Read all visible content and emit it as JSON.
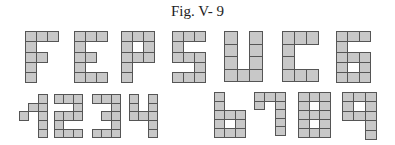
{
  "caption": "Fig. V- 9",
  "colors": {
    "fill": "#c8c8c8",
    "stroke": "#555555",
    "hole": "#ffffff"
  },
  "glyphs": [
    {
      "char": "F",
      "x": 25,
      "y": 31,
      "cw": 11,
      "ch": 10.3,
      "rows": [
        "###",
        "#..",
        "##.",
        "#..",
        "#.."
      ]
    },
    {
      "char": "E",
      "x": 74,
      "y": 31,
      "cw": 11,
      "ch": 10.3,
      "rows": [
        "###",
        "#..",
        "##.",
        "#..",
        "###"
      ]
    },
    {
      "char": "P",
      "x": 121,
      "y": 31,
      "cw": 11,
      "ch": 10.3,
      "rows": [
        "###",
        "#o#",
        "###",
        "#..",
        "#.."
      ]
    },
    {
      "char": "S",
      "x": 172,
      "y": 31,
      "cw": 11,
      "ch": 10.3,
      "rows": [
        "###",
        "#..",
        "###",
        "..#",
        "###"
      ]
    },
    {
      "char": "U",
      "x": 224,
      "y": 31,
      "cw": 12.7,
      "ch": 12.5,
      "rows": [
        "#.#",
        "#.#",
        "#.#",
        "###"
      ]
    },
    {
      "char": "C",
      "x": 282,
      "y": 31,
      "cw": 12,
      "ch": 12.5,
      "rows": [
        "###",
        "#..",
        "#..",
        "###"
      ]
    },
    {
      "char": "6",
      "x": 336,
      "y": 31,
      "cw": 11.3,
      "ch": 10.3,
      "rows": [
        "###",
        "#..",
        "###",
        "#o#",
        "###"
      ]
    },
    {
      "char": "1",
      "x": 19,
      "y": 94,
      "cw": 9.3,
      "ch": 8.7,
      "rows": [
        "..#",
        ".##",
        "#.#",
        "..#",
        "..#"
      ]
    },
    {
      "char": "2",
      "x": 54,
      "y": 94,
      "cw": 9.3,
      "ch": 8.7,
      "rows": [
        "###",
        "..#",
        "###",
        "#..",
        "###"
      ]
    },
    {
      "char": "3",
      "x": 92,
      "y": 94,
      "cw": 9.3,
      "ch": 8.7,
      "rows": [
        "###",
        "..#",
        ".##",
        "..#",
        "###"
      ]
    },
    {
      "char": "4",
      "x": 129,
      "y": 94,
      "cw": 9.3,
      "ch": 8.7,
      "rows": [
        "#.#",
        "#.#",
        "###",
        "..#",
        "..#"
      ]
    },
    {
      "char": "6",
      "x": 214,
      "y": 92,
      "cw": 10.3,
      "ch": 9,
      "rows": [
        "#..",
        "#..",
        "###",
        "#o#",
        "###"
      ]
    },
    {
      "char": "7",
      "x": 254,
      "y": 92,
      "cw": 10.3,
      "ch": 8.6,
      "rows": [
        "###",
        "#.#",
        "..#",
        "..#",
        "..#"
      ]
    },
    {
      "char": "8",
      "x": 298,
      "y": 92,
      "cw": 10.7,
      "ch": 9,
      "rows": [
        "###",
        "#o#",
        "###",
        "#o#",
        "###"
      ]
    },
    {
      "char": "9",
      "x": 342,
      "y": 92,
      "cw": 11.3,
      "ch": 9.4,
      "rows": [
        "###",
        "#o#",
        "###",
        "..#",
        "..#"
      ]
    }
  ]
}
